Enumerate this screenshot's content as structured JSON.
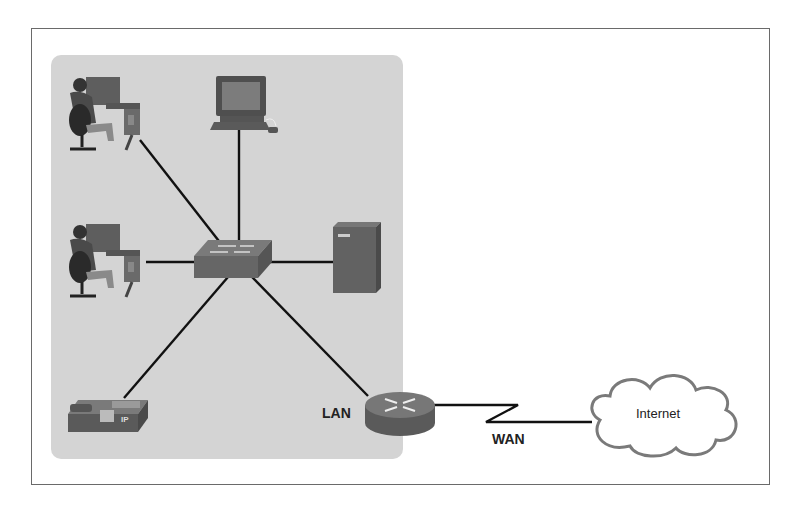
{
  "diagram": {
    "title": "",
    "lan_label": "LAN",
    "wan_label": "WAN",
    "cloud_label": "Internet",
    "phone_badge": "IP",
    "colors": {
      "panel": "#d4d4d4",
      "device": "#6e6e6e",
      "device_dark": "#4a4a4a",
      "link": "#111111",
      "frame": "#6a6a6a",
      "cloud_stroke": "#777777"
    },
    "nodes": [
      {
        "id": "workstation-1",
        "type": "user-workstation"
      },
      {
        "id": "pc",
        "type": "desktop-computer"
      },
      {
        "id": "workstation-2",
        "type": "user-workstation"
      },
      {
        "id": "switch",
        "type": "switch"
      },
      {
        "id": "server",
        "type": "server"
      },
      {
        "id": "ip-phone",
        "type": "ip-phone"
      },
      {
        "id": "router",
        "type": "router"
      },
      {
        "id": "internet",
        "type": "cloud"
      }
    ],
    "links": [
      {
        "from": "workstation-1",
        "to": "switch",
        "kind": "ethernet"
      },
      {
        "from": "pc",
        "to": "switch",
        "kind": "ethernet"
      },
      {
        "from": "workstation-2",
        "to": "switch",
        "kind": "ethernet"
      },
      {
        "from": "server",
        "to": "switch",
        "kind": "ethernet"
      },
      {
        "from": "ip-phone",
        "to": "switch",
        "kind": "ethernet"
      },
      {
        "from": "router",
        "to": "switch",
        "kind": "ethernet"
      },
      {
        "from": "router",
        "to": "internet",
        "kind": "serial-wan"
      }
    ]
  }
}
